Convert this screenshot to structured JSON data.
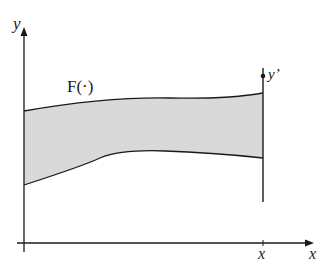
{
  "diagram": {
    "labels": {
      "y_axis": "y",
      "x_axis": "x",
      "x_tick": "x",
      "function": "F(·)",
      "y_prime": "y’"
    },
    "colors": {
      "line": "#1a1a1a",
      "fill": "#d9d9d9",
      "background": "#ffffff"
    },
    "shapes": {
      "y_axis": {
        "x": 24,
        "y_top": 28,
        "y_bottom": 252
      },
      "x_axis": {
        "y": 243,
        "x_left": 17,
        "x_right": 313
      },
      "vertical_line": {
        "x": 263,
        "y_top": 68,
        "y_bottom": 202,
        "dot_y": 76
      },
      "region_upper_curve": "M24,111 C70,103 120,97 170,98 C215,99 240,97 263,93",
      "region_lower_curve": "M24,185 C55,175 85,165 100,158 C115,152 140,150 165,151 C200,152 235,155 263,158"
    }
  }
}
